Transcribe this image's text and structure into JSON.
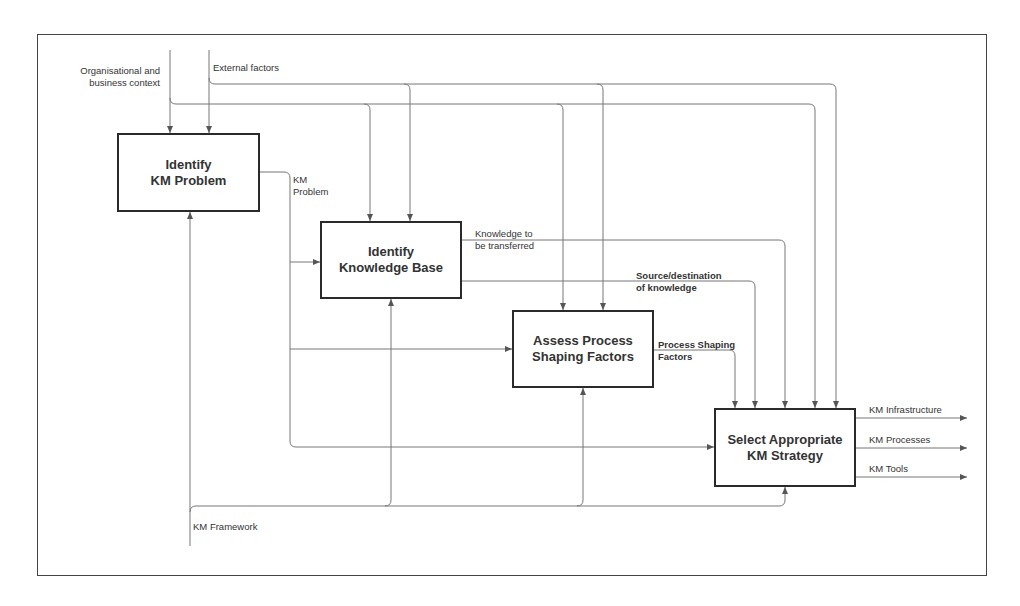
{
  "diagram": {
    "type": "IDEF0 process diagram",
    "boxes": [
      {
        "id": "identify-km-problem",
        "label": "Identify\nKM Problem"
      },
      {
        "id": "identify-knowledge-base",
        "label": "Identify\nKnowledge Base"
      },
      {
        "id": "assess-process-shaping-factors",
        "label": "Assess Process\nShaping Factors"
      },
      {
        "id": "select-km-strategy",
        "label": "Select Appropriate\nKM Strategy"
      }
    ],
    "controls": {
      "org_context": "Organisational and\nbusiness context",
      "external_factors": "External factors"
    },
    "flows": {
      "km_problem": "KM\nProblem",
      "knowledge_to_transfer": "Knowledge to\nbe transferred",
      "source_destination": "Source/destination\nof knowledge",
      "process_shaping": "Process Shaping\nFactors"
    },
    "outputs": [
      "KM Infrastructure",
      "KM Processes",
      "KM Tools"
    ],
    "mechanism": "KM Framework",
    "colors": {
      "line": "#777777",
      "box_border": "#2a2a2a",
      "text": "#333333"
    }
  }
}
